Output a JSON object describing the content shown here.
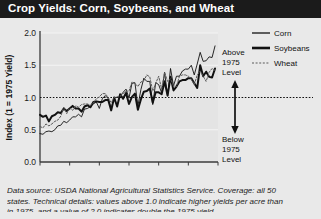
{
  "title": "Crop Yields: Corn, Soybeans, and Wheat",
  "footnote": {
    "line1": "Data source: USDA National Agricultural Statistics Service. Coverage: all 50",
    "line2": "states. Technical details: values above 1.0 indicate higher yields per acre than",
    "line3": "in 1975, and a value of 2.0 indicates double the 1975 yield."
  },
  "annotations": {
    "above": {
      "l1": "Above",
      "l2": "1975",
      "l3": "Level"
    },
    "below": {
      "l1": "Below",
      "l2": "1975",
      "l3": "Level"
    }
  },
  "legend": {
    "items": [
      {
        "label": "Corn",
        "style": "thin-solid",
        "color": "#111111"
      },
      {
        "label": "Soybeans",
        "style": "thick-solid",
        "color": "#111111"
      },
      {
        "label": "Wheat",
        "style": "dashed",
        "color": "#555555"
      }
    ]
  },
  "colors": {
    "titlebar": "#1b1b1b",
    "titletext": "#ffffff",
    "background": "#e9e9e9",
    "plotbg": "#e3e3e3",
    "gridline": "#f4f4f4",
    "axis": "#3a3a3a",
    "reference": "#111111"
  },
  "chart_data": {
    "type": "line",
    "title": "Crop Yields: Corn, Soybeans, and Wheat",
    "xlabel": "",
    "ylabel": "Index (1 = 1975 Yield)",
    "xlim": [
      1950,
      2010
    ],
    "ylim": [
      0.0,
      2.0
    ],
    "xticks": [
      1950,
      1960,
      1970,
      1980,
      1990,
      2000,
      2010
    ],
    "yticks": [
      0.0,
      0.5,
      1.0,
      1.5,
      2.0
    ],
    "ytick_labels": [
      "0.0",
      "0.5",
      "1.0",
      "1.5",
      "2.0"
    ],
    "grid": true,
    "legend_position": "right",
    "reference_line": {
      "y": 1.0,
      "style": "dotted",
      "label": "1975 level"
    },
    "x": [
      1950,
      1951,
      1952,
      1953,
      1954,
      1955,
      1956,
      1957,
      1958,
      1959,
      1960,
      1961,
      1962,
      1963,
      1964,
      1965,
      1966,
      1967,
      1968,
      1969,
      1970,
      1971,
      1972,
      1973,
      1974,
      1975,
      1976,
      1977,
      1978,
      1979,
      1980,
      1981,
      1982,
      1983,
      1984,
      1985,
      1986,
      1987,
      1988,
      1989,
      1990,
      1991,
      1992,
      1993,
      1994,
      1995,
      1996,
      1997,
      1998,
      1999,
      2000,
      2001,
      2002,
      2003,
      2004,
      2005,
      2006,
      2007,
      2008,
      2009
    ],
    "series": [
      {
        "name": "Corn",
        "style": "thin-solid",
        "values": [
          0.44,
          0.43,
          0.47,
          0.48,
          0.47,
          0.5,
          0.56,
          0.57,
          0.63,
          0.61,
          0.65,
          0.7,
          0.7,
          0.74,
          0.7,
          0.82,
          0.83,
          0.86,
          0.9,
          0.93,
          0.83,
          0.98,
          1.03,
          0.98,
          0.83,
          1.0,
          1.0,
          1.02,
          1.08,
          1.13,
          0.99,
          1.22,
          1.23,
          0.87,
          1.12,
          1.3,
          1.25,
          1.25,
          0.89,
          1.23,
          1.2,
          1.07,
          1.39,
          1.02,
          1.45,
          1.18,
          1.33,
          1.33,
          1.41,
          1.44,
          1.44,
          1.5,
          1.35,
          1.52,
          1.7,
          1.56,
          1.57,
          1.63,
          1.62,
          1.8
        ]
      },
      {
        "name": "Soybeans",
        "style": "thick-solid",
        "values": [
          0.73,
          0.7,
          0.72,
          0.63,
          0.71,
          0.73,
          0.77,
          0.76,
          0.83,
          0.79,
          0.83,
          0.87,
          0.83,
          0.83,
          0.78,
          0.86,
          0.88,
          0.85,
          0.93,
          0.94,
          0.93,
          0.93,
          0.96,
          0.96,
          0.8,
          1.0,
          0.86,
          1.05,
          0.98,
          1.07,
          0.9,
          1.01,
          1.06,
          0.81,
          0.97,
          1.09,
          1.1,
          1.14,
          0.92,
          1.08,
          1.08,
          1.05,
          1.25,
          1.03,
          1.32,
          1.11,
          1.17,
          1.25,
          1.27,
          1.27,
          1.3,
          1.3,
          1.22,
          1.15,
          1.5,
          1.33,
          1.4,
          1.32,
          1.31,
          1.45
        ]
      },
      {
        "name": "Wheat",
        "style": "dashed",
        "values": [
          0.55,
          0.53,
          0.59,
          0.56,
          0.59,
          0.63,
          0.65,
          0.71,
          0.85,
          0.75,
          0.84,
          0.8,
          0.87,
          0.85,
          0.89,
          0.9,
          0.9,
          0.88,
          0.92,
          0.98,
          1.01,
          1.06,
          1.06,
          1.0,
          0.92,
          1.0,
          1.01,
          1.02,
          1.06,
          1.1,
          1.1,
          1.24,
          1.22,
          1.17,
          1.24,
          1.26,
          1.35,
          1.32,
          1.1,
          1.22,
          1.33,
          1.13,
          1.39,
          1.25,
          1.29,
          1.18,
          1.17,
          1.33,
          1.35,
          1.35,
          1.33,
          1.29,
          1.2,
          1.35,
          1.41,
          1.33,
          1.25,
          1.39,
          1.45,
          1.42
        ]
      }
    ]
  }
}
